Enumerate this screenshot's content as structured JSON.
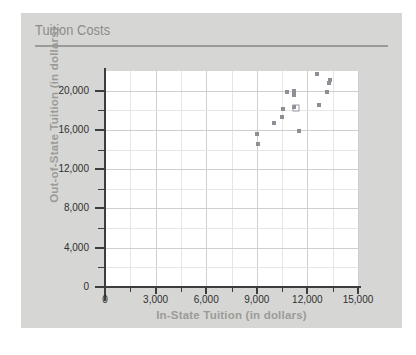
{
  "card": {
    "title": "Tuition Costs"
  },
  "chart_data": {
    "type": "scatter",
    "title": "Tuition Costs",
    "xlabel": "In-State Tuition (in dollars)",
    "ylabel": "Out-of-State Tuition (in dollars)",
    "xlim": [
      0,
      15000
    ],
    "ylim": [
      0,
      22000
    ],
    "xticks": [
      0,
      3000,
      6000,
      9000,
      12000,
      15000
    ],
    "xtick_labels": [
      "0",
      "3,000",
      "6,000",
      "9,000",
      "12,000",
      "15,000"
    ],
    "yticks": [
      0,
      4000,
      8000,
      12000,
      16000,
      20000
    ],
    "ytick_labels": [
      "0",
      "4,000",
      "8,000",
      "12,000",
      "16,000",
      "20,000"
    ],
    "minor_ticks": true,
    "grid": true,
    "legend": null,
    "marker_color": "#8e8e96",
    "points": [
      {
        "x": 9030,
        "y": 15560,
        "marker": "filled"
      },
      {
        "x": 9090,
        "y": 14570,
        "marker": "filled"
      },
      {
        "x": 10000,
        "y": 16680,
        "marker": "filled"
      },
      {
        "x": 10510,
        "y": 17290,
        "marker": "filled"
      },
      {
        "x": 10540,
        "y": 18170,
        "marker": "filled"
      },
      {
        "x": 10780,
        "y": 19840,
        "marker": "filled"
      },
      {
        "x": 11200,
        "y": 19930,
        "marker": "filled"
      },
      {
        "x": 11210,
        "y": 19560,
        "marker": "filled"
      },
      {
        "x": 11220,
        "y": 18310,
        "marker": "filled"
      },
      {
        "x": 11330,
        "y": 18280,
        "marker": "open"
      },
      {
        "x": 11480,
        "y": 15840,
        "marker": "filled"
      },
      {
        "x": 12540,
        "y": 21740,
        "marker": "filled"
      },
      {
        "x": 12700,
        "y": 18520,
        "marker": "filled"
      },
      {
        "x": 13140,
        "y": 19840,
        "marker": "filled"
      },
      {
        "x": 13270,
        "y": 20780,
        "marker": "filled"
      },
      {
        "x": 13330,
        "y": 21090,
        "marker": "filled"
      }
    ]
  }
}
